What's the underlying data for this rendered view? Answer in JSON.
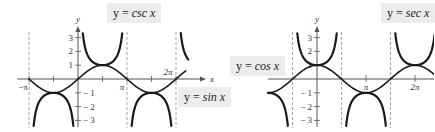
{
  "chart_data": [
    {
      "type": "line",
      "title": "",
      "xlabel": "x",
      "ylabel": "y",
      "x_tick_labels": [
        "-π",
        "π",
        "2π"
      ],
      "y_tick_labels": [
        "3",
        "2",
        "1",
        "-1",
        "-2",
        "-3"
      ],
      "xlim": [
        -3.5,
        7.0
      ],
      "ylim": [
        -3.5,
        3.5
      ],
      "grid": false,
      "asymptotes": [
        "-π",
        "π",
        "2π"
      ],
      "series": [
        {
          "name": "y = csc x",
          "function": "csc(x)",
          "style": "thick"
        },
        {
          "name": "y = sin x",
          "function": "sin(x)",
          "style": "medium"
        }
      ],
      "annotations": [
        "y = csc x",
        "y = sin x"
      ]
    },
    {
      "type": "line",
      "title": "",
      "xlabel": "",
      "ylabel": "y",
      "x_tick_labels": [
        "π",
        "2π"
      ],
      "y_tick_labels": [
        "3",
        "2",
        "1",
        "-1",
        "-2",
        "-3"
      ],
      "xlim": [
        -3.14,
        7.0
      ],
      "ylim": [
        -3.5,
        3.5
      ],
      "grid": false,
      "asymptotes": [
        "-π/2",
        "π/2",
        "3π/2"
      ],
      "series": [
        {
          "name": "y = sec x",
          "function": "sec(x)",
          "style": "thick"
        },
        {
          "name": "y = cos x",
          "function": "cos(x)",
          "style": "medium"
        }
      ],
      "annotations": [
        "y = cos x",
        "y = sec x"
      ]
    }
  ],
  "labels": {
    "csc": {
      "lhs": "y  =",
      "rhs": "csc x"
    },
    "sin": {
      "lhs": "y  =",
      "rhs": "sin x"
    },
    "cos": {
      "lhs": "y  =",
      "rhs": "cos x"
    },
    "sec": {
      "lhs": "y  =",
      "rhs": "sec x"
    }
  },
  "axes": {
    "g1": {
      "x_label": "x",
      "y_label": "y",
      "neg_pi": "−π",
      "pi": "π",
      "two_pi": "2π",
      "y3": "3",
      "y2": "2",
      "y1": "1",
      "ym1": "− 1",
      "ym2": "− 2",
      "ym3": "− 3"
    },
    "g2": {
      "y_label": "y",
      "pi": "π",
      "two_pi": "2π",
      "y3": "3",
      "y2": "2",
      "y1": "1",
      "ym1": "− 1",
      "ym2": "− 2",
      "ym3": "− 3"
    }
  },
  "colors": {
    "curve": "#1a1a1a",
    "axis": "#555555",
    "asymptote": "#9a9a9a",
    "label_bg": "#ececec"
  }
}
